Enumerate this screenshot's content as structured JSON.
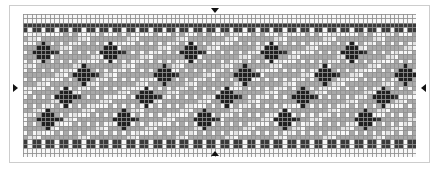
{
  "document": {
    "title": "Beaded Band Pattern Chart",
    "kind": "cross-stitch-grid-chart"
  },
  "grid": {
    "columns": 88,
    "rows": 32,
    "cell_size_px": 4.47,
    "origin_x_px": 23,
    "origin_y_px": 14,
    "gridline_color": "#8f8f8f",
    "gridline_width_px": 1
  },
  "palette": {
    "white": "#f7f7f7",
    "light": "#e2e2e2",
    "gray": "#a8a8a8",
    "mid_gray": "#9a9a9a",
    "dark": "#3a3a3a",
    "black": "#202020",
    "background": "#ffffff",
    "frame": "#cdcdcd",
    "marker": "#121212"
  },
  "symbols": [
    {
      "key": "white",
      "name": "white-bead",
      "color": "#f7f7f7"
    },
    {
      "key": "light",
      "name": "light-gray-bead",
      "color": "#e2e2e2"
    },
    {
      "key": "gray",
      "name": "gray-bead",
      "color": "#a8a8a8"
    },
    {
      "key": "dark",
      "name": "dark-gray-bead",
      "color": "#5a5a5a"
    },
    {
      "key": "black",
      "name": "black-bead",
      "color": "#2b2b2b"
    }
  ],
  "pattern": {
    "border_rows": [
      2,
      3,
      28,
      29
    ],
    "border_color": "dark",
    "border_dot_color": "white",
    "border_dot_period": 3,
    "field_rows": [
      4,
      27
    ],
    "diagonal": {
      "description": "light diagonal stripes rising left-to-right over gray field",
      "period_columns": 11,
      "slope": -0.5,
      "stripe_width_cells": 2
    },
    "motif": {
      "name": "plus-cross",
      "color": "black",
      "width_cells": 5,
      "height_cells": 5,
      "count": 20,
      "positions": [
        {
          "col": 4,
          "row": 8
        },
        {
          "col": 19,
          "row": 8
        },
        {
          "col": 37,
          "row": 8
        },
        {
          "col": 55,
          "row": 8
        },
        {
          "col": 73,
          "row": 8
        },
        {
          "col": 13,
          "row": 13
        },
        {
          "col": 31,
          "row": 13
        },
        {
          "col": 49,
          "row": 13
        },
        {
          "col": 67,
          "row": 13
        },
        {
          "col": 85,
          "row": 13
        },
        {
          "col": 9,
          "row": 18
        },
        {
          "col": 27,
          "row": 18
        },
        {
          "col": 45,
          "row": 18
        },
        {
          "col": 62,
          "row": 18
        },
        {
          "col": 80,
          "row": 18
        },
        {
          "col": 5,
          "row": 23
        },
        {
          "col": 22,
          "row": 23
        },
        {
          "col": 40,
          "row": 23
        },
        {
          "col": 58,
          "row": 23
        },
        {
          "col": 76,
          "row": 23
        }
      ]
    }
  },
  "markers": [
    {
      "id": "marker-top",
      "name": "center-marker-top",
      "direction": "down",
      "axis": "horizontal",
      "position_column": 44
    },
    {
      "id": "marker-bottom",
      "name": "center-marker-bottom",
      "direction": "up",
      "axis": "horizontal",
      "position_column": 44
    },
    {
      "id": "marker-left",
      "name": "center-marker-left",
      "direction": "right",
      "axis": "vertical",
      "position_row": 16
    },
    {
      "id": "marker-right",
      "name": "center-marker-right",
      "direction": "left",
      "axis": "vertical",
      "position_row": 16
    }
  ],
  "chart_data": {
    "type": "heatmap",
    "xlabel": "",
    "ylabel": "",
    "grid": true,
    "legend_position": "none",
    "columns": 88,
    "rows": 32,
    "value_labels": [
      "white",
      "light",
      "gray",
      "dark",
      "black"
    ],
    "value_colors": [
      "#f7f7f7",
      "#e2e2e2",
      "#a8a8a8",
      "#5a5a5a",
      "#2b2b2b"
    ]
  }
}
